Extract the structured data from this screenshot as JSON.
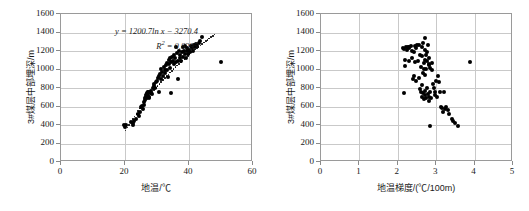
{
  "figure": {
    "background": "#ffffff",
    "point_color": "#000000",
    "grid_color": "#c9c9c9",
    "frame_color": "#9a9a9a"
  },
  "charts": [
    {
      "id": "left",
      "type": "scatter",
      "title": "",
      "xlabel": "地温/℃",
      "ylabel": "3#煤层中部埋深/m",
      "xlim": [
        0,
        60
      ],
      "ylim": [
        0,
        1600
      ],
      "xticks": [
        "0",
        "20",
        "40",
        "60"
      ],
      "yticks": [
        "0",
        "200",
        "400",
        "600",
        "800",
        "1000",
        "1200",
        "1400",
        "1600"
      ],
      "grid": "both",
      "legend": "none",
      "annotations": {
        "equation": "y = 1200.7ln x − 3270.4",
        "r2_prefix": "R",
        "r2_exp": "2",
        "r2_value": " = 0.8395"
      },
      "trendline": {
        "kind": "logarithmic",
        "coefficient": 1200.7,
        "intercept": -3270.4,
        "r2": 0.8395,
        "style": "dotted",
        "x_start": 20.2,
        "x_end": 48.0
      },
      "points": [
        [
          19.8,
          395
        ],
        [
          20.1,
          378
        ],
        [
          20.4,
          402
        ],
        [
          21.9,
          432
        ],
        [
          22.4,
          418
        ],
        [
          22.6,
          405
        ],
        [
          22.9,
          445
        ],
        [
          23.4,
          470
        ],
        [
          24.0,
          520
        ],
        [
          24.3,
          500
        ],
        [
          24.6,
          545
        ],
        [
          25.1,
          590
        ],
        [
          25.3,
          610
        ],
        [
          25.5,
          572
        ],
        [
          25.8,
          620
        ],
        [
          25.9,
          648
        ],
        [
          26.1,
          672
        ],
        [
          26.3,
          690
        ],
        [
          26.5,
          705
        ],
        [
          26.6,
          720
        ],
        [
          26.8,
          735
        ],
        [
          26.9,
          718
        ],
        [
          27.0,
          742
        ],
        [
          27.1,
          755
        ],
        [
          27.2,
          728
        ],
        [
          27.3,
          762
        ],
        [
          27.4,
          700
        ],
        [
          27.6,
          690
        ],
        [
          27.8,
          755
        ],
        [
          28.0,
          770
        ],
        [
          28.2,
          748
        ],
        [
          28.5,
          735
        ],
        [
          28.8,
          795
        ],
        [
          29.0,
          820
        ],
        [
          29.2,
          843
        ],
        [
          29.5,
          800
        ],
        [
          29.8,
          860
        ],
        [
          30.1,
          880
        ],
        [
          30.3,
          905
        ],
        [
          30.5,
          760
        ],
        [
          30.7,
          930
        ],
        [
          31.0,
          948
        ],
        [
          31.2,
          895
        ],
        [
          31.4,
          1010
        ],
        [
          31.6,
          975
        ],
        [
          31.9,
          930
        ],
        [
          32.1,
          1030
        ],
        [
          32.4,
          1000
        ],
        [
          32.6,
          958
        ],
        [
          32.8,
          1048
        ],
        [
          33.0,
          1075
        ],
        [
          33.2,
          1000
        ],
        [
          33.4,
          920
        ],
        [
          33.6,
          1108
        ],
        [
          33.8,
          1060
        ],
        [
          34.0,
          1020
        ],
        [
          34.2,
          1125
        ],
        [
          34.4,
          1085
        ],
        [
          34.5,
          750
        ],
        [
          34.8,
          1140
        ],
        [
          35.0,
          1095
        ],
        [
          35.2,
          1155
        ],
        [
          35.4,
          1060
        ],
        [
          35.6,
          1128
        ],
        [
          35.8,
          1240
        ],
        [
          36.0,
          1080
        ],
        [
          36.3,
          1175
        ],
        [
          36.5,
          1090
        ],
        [
          36.7,
          900
        ],
        [
          36.9,
          1200
        ],
        [
          37.1,
          1120
        ],
        [
          37.3,
          1160
        ],
        [
          37.5,
          1095
        ],
        [
          37.7,
          1185
        ],
        [
          38.0,
          1240
        ],
        [
          38.2,
          1140
        ],
        [
          38.4,
          1205
        ],
        [
          38.6,
          1170
        ],
        [
          38.8,
          1250
        ],
        [
          39.0,
          1125
        ],
        [
          39.3,
          1195
        ],
        [
          39.5,
          1230
        ],
        [
          39.8,
          1165
        ],
        [
          40.1,
          1215
        ],
        [
          40.4,
          1185
        ],
        [
          40.6,
          1255
        ],
        [
          40.9,
          1230
        ],
        [
          41.2,
          1200
        ],
        [
          41.5,
          1260
        ],
        [
          41.8,
          1240
        ],
        [
          42.2,
          1275
        ],
        [
          42.6,
          1250
        ],
        [
          43.0,
          1290
        ],
        [
          43.5,
          1305
        ],
        [
          44.2,
          1350
        ],
        [
          49.9,
          1085
        ]
      ]
    },
    {
      "id": "right",
      "type": "scatter",
      "title": "",
      "xlabel": "地温梯度/(℃/100m)",
      "ylabel": "3#煤层中部埋深/m",
      "xlim": [
        0,
        5
      ],
      "ylim": [
        0,
        1600
      ],
      "xticks": [
        "0",
        "1",
        "2",
        "3",
        "4",
        "5"
      ],
      "yticks": [
        "0",
        "200",
        "400",
        "600",
        "800",
        "1000",
        "1200",
        "1400",
        "1600"
      ],
      "grid": "both",
      "legend": "none",
      "annotations": {},
      "points": [
        [
          2.13,
          1230
        ],
        [
          2.16,
          1225
        ],
        [
          2.18,
          1035
        ],
        [
          2.2,
          1100
        ],
        [
          2.22,
          1240
        ],
        [
          2.24,
          1215
        ],
        [
          2.26,
          1240
        ],
        [
          2.28,
          1095
        ],
        [
          2.3,
          1245
        ],
        [
          2.15,
          748
        ],
        [
          2.34,
          1250
        ],
        [
          2.36,
          1125
        ],
        [
          2.38,
          1205
        ],
        [
          2.4,
          900
        ],
        [
          2.42,
          1190
        ],
        [
          2.44,
          1255
        ],
        [
          2.46,
          1080
        ],
        [
          2.48,
          880
        ],
        [
          2.5,
          1260
        ],
        [
          2.52,
          1090
        ],
        [
          2.41,
          930
        ],
        [
          2.55,
          1270
        ],
        [
          2.58,
          1160
        ],
        [
          2.6,
          1030
        ],
        [
          2.62,
          1240
        ],
        [
          2.64,
          1145
        ],
        [
          2.66,
          1285
        ],
        [
          2.68,
          1070
        ],
        [
          2.7,
          1340
        ],
        [
          2.72,
          1210
        ],
        [
          2.74,
          1005
        ],
        [
          2.76,
          1190
        ],
        [
          2.78,
          1265
        ],
        [
          2.8,
          1120
        ],
        [
          2.82,
          1050
        ],
        [
          2.56,
          905
        ],
        [
          2.58,
          790
        ],
        [
          2.6,
          760
        ],
        [
          2.62,
          835
        ],
        [
          2.64,
          700
        ],
        [
          2.66,
          745
        ],
        [
          2.68,
          680
        ],
        [
          2.7,
          770
        ],
        [
          2.72,
          720
        ],
        [
          2.74,
          690
        ],
        [
          2.76,
          800
        ],
        [
          2.78,
          735
        ],
        [
          2.8,
          660
        ],
        [
          2.82,
          705
        ],
        [
          2.84,
          760
        ],
        [
          2.86,
          690
        ],
        [
          2.66,
          960
        ],
        [
          2.68,
          1010
        ],
        [
          2.72,
          945
        ],
        [
          2.76,
          1090
        ],
        [
          2.8,
          1060
        ],
        [
          2.84,
          1020
        ],
        [
          2.88,
          1075
        ],
        [
          2.9,
          990
        ],
        [
          2.92,
          845
        ],
        [
          2.94,
          800
        ],
        [
          2.96,
          760
        ],
        [
          2.98,
          720
        ],
        [
          2.84,
          390
        ],
        [
          3.0,
          880
        ],
        [
          3.02,
          700
        ],
        [
          3.05,
          935
        ],
        [
          3.08,
          860
        ],
        [
          3.1,
          755
        ],
        [
          3.12,
          600
        ],
        [
          3.14,
          580
        ],
        [
          3.18,
          540
        ],
        [
          3.2,
          755
        ],
        [
          3.22,
          570
        ],
        [
          3.26,
          600
        ],
        [
          3.3,
          560
        ],
        [
          3.34,
          520
        ],
        [
          3.4,
          470
        ],
        [
          3.44,
          440
        ],
        [
          3.5,
          420
        ],
        [
          3.56,
          385
        ],
        [
          2.3,
          1235
        ],
        [
          2.48,
          1230
        ],
        [
          2.7,
          1100
        ],
        [
          2.74,
          1160
        ],
        [
          3.88,
          1080
        ]
      ]
    }
  ]
}
